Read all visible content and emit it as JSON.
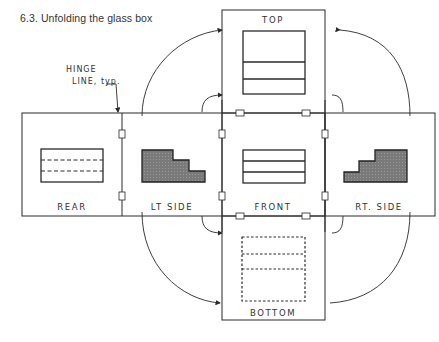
{
  "figure": {
    "caption": "6.3. Unfolding the glass box",
    "annotation": {
      "line1": "HINGE",
      "line2": "LINE, typ."
    },
    "faces": {
      "top": "TOP",
      "rear": "REAR",
      "left_side": "LT SIDE",
      "front": "FRONT",
      "right_side": "RT. SIDE",
      "bottom": "BOTTOM"
    },
    "colors": {
      "line": "#2a2a2a",
      "shaded": "#6e6e6e",
      "text": "#333333"
    }
  }
}
